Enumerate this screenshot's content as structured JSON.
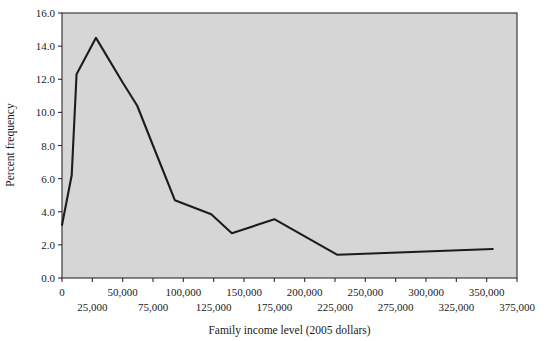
{
  "chart_data": {
    "type": "line",
    "title": "",
    "xlabel": "Family income level (2005 dollars)",
    "ylabel": "Percent frequency",
    "xlim": [
      0,
      375000
    ],
    "ylim": [
      0,
      16
    ],
    "grid": false,
    "legend": null,
    "x_tick_labels_upper": [
      "0",
      "50,000",
      "100,000",
      "150,000",
      "200,000",
      "250,000",
      "300,000",
      "350,000"
    ],
    "x_tick_values_upper": [
      0,
      50000,
      100000,
      150000,
      200000,
      250000,
      300000,
      350000
    ],
    "x_tick_labels_lower": [
      "25,000",
      "75,000",
      "125,000",
      "175,000",
      "225,000",
      "275,000",
      "325,000",
      "375,000"
    ],
    "x_tick_values_lower": [
      25000,
      75000,
      125000,
      175000,
      225000,
      275000,
      325000,
      375000
    ],
    "y_tick_labels": [
      "0.0",
      "2.0",
      "4.0",
      "6.0",
      "8.0",
      "10.0",
      "12.0",
      "14.0",
      "16.0"
    ],
    "y_tick_values": [
      0,
      2,
      4,
      6,
      8,
      10,
      12,
      14,
      16
    ],
    "series": [
      {
        "name": "Percent frequency",
        "x": [
          0,
          8000,
          12000,
          28000,
          50000,
          62000,
          75000,
          93000,
          123000,
          140000,
          175000,
          227000,
          355000
        ],
        "y": [
          3.2,
          6.2,
          12.3,
          14.5,
          11.8,
          10.4,
          8.0,
          4.7,
          3.85,
          2.7,
          3.55,
          1.4,
          1.75
        ]
      }
    ],
    "colors": {
      "line": "#1c1c1c",
      "plot_background": "#d6d6d6",
      "frame": "#2a2a2a",
      "text": "#1a1a1a",
      "page_background": "#ffffff"
    }
  }
}
